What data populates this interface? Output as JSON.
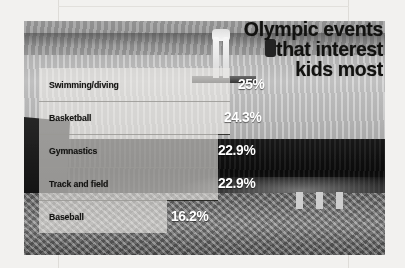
{
  "title": {
    "line1": "Olympic events",
    "line2": "that interest",
    "line3": "kids most"
  },
  "colors": {
    "title_text": "#121210",
    "label_text": "#151513",
    "value_text": "#ffffff",
    "bar_fill": "rgba(236,235,231,0.60)",
    "page_background": "#f2f1ef"
  },
  "chart_data": {
    "type": "bar",
    "title": "Olympic events that interest kids most",
    "xlabel": "",
    "ylabel": "",
    "orientation": "horizontal",
    "grid": false,
    "legend": null,
    "xlim": [
      0,
      25
    ],
    "categories": [
      "Swimming/diving",
      "Basketball",
      "Gymnastics",
      "Track and field",
      "Baseball"
    ],
    "values": [
      25,
      24.3,
      22.9,
      22.9,
      16.2
    ],
    "value_labels": [
      "25%",
      "24.3%",
      "22.9%",
      "22.9%",
      "16.2%"
    ],
    "bars": [
      {
        "label": "Swimming/diving",
        "value": 25,
        "value_label": "25%",
        "bar_width_px": 191,
        "value_left_px": 199
      },
      {
        "label": "Basketball",
        "value": 24.3,
        "value_label": "24.3%",
        "bar_width_px": 191,
        "value_left_px": 185
      },
      {
        "label": "Gymnastics",
        "value": 22.9,
        "value_label": "22.9%",
        "bar_width_px": 179,
        "value_left_px": 179
      },
      {
        "label": "Track and field",
        "value": 22.9,
        "value_label": "22.9%",
        "bar_width_px": 179,
        "value_left_px": 179
      },
      {
        "label": "Baseball",
        "value": 16.2,
        "value_label": "16.2%",
        "bar_width_px": 128,
        "value_left_px": 132
      }
    ]
  }
}
